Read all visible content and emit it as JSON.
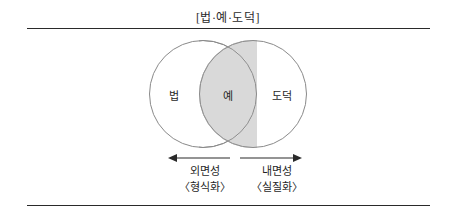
{
  "figure": {
    "title": "[법·예·도덕]",
    "rules": {
      "top": "horizontal-rule",
      "bottom": "horizontal-rule"
    }
  },
  "venn": {
    "left_circle": {
      "label": "법",
      "stroke_color": "#8a8a8a",
      "fill_color": "#ffffff"
    },
    "intersection": {
      "label": "예",
      "fill_color": "#d9d9d9"
    },
    "right_circle": {
      "label": "도덕",
      "stroke_color": "#8a8a8a",
      "fill_color": "#ffffff"
    }
  },
  "axes": {
    "left": {
      "arrow_direction": "left",
      "main": "외면성",
      "sub": "〈형식화〉"
    },
    "right": {
      "arrow_direction": "right",
      "main": "내면성",
      "sub": "〈실질화〉"
    }
  },
  "colors": {
    "text": "#1f1f1f",
    "rule": "#2a2a2a",
    "shade": "#d9d9d9",
    "outline": "#8a8a8a"
  }
}
